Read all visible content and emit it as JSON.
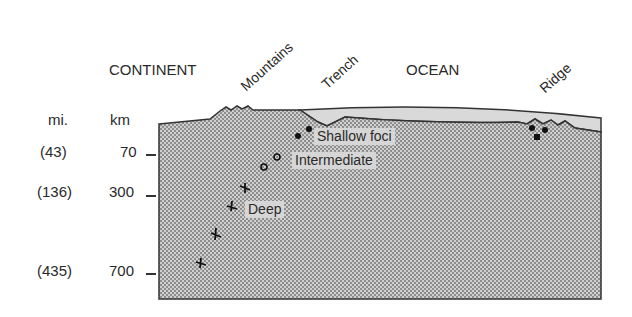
{
  "diagram": {
    "type": "cross-section",
    "headings": {
      "continent": "CONTINENT",
      "ocean": "OCEAN"
    },
    "features": {
      "mountains": "Mountains",
      "trench": "Trench",
      "ridge": "Ridge"
    },
    "axis": {
      "mi_header": "mi.",
      "km_header": "km",
      "ticks": [
        {
          "mi": "(43)",
          "km": "70"
        },
        {
          "mi": "(136)",
          "km": "300"
        },
        {
          "mi": "(435)",
          "km": "700"
        }
      ]
    },
    "foci_labels": {
      "shallow": "Shallow foci",
      "intermediate": "Intermediate",
      "deep": "Deep"
    },
    "colors": {
      "crust_fill": "#cfcfcf",
      "stipple_dot": "#6e6e6e",
      "ocean_water": "#d9d9d9",
      "outline": "#333333"
    }
  }
}
